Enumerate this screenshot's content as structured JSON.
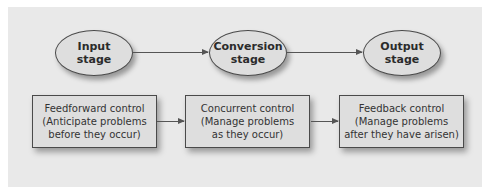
{
  "stages": [
    {
      "line1": "Input",
      "line2": "stage"
    },
    {
      "line1": "Conversion",
      "line2": "stage"
    },
    {
      "line1": "Output",
      "line2": "stage"
    }
  ],
  "controls": [
    {
      "title": "Feedforward control",
      "line2": "(Anticipate problems",
      "line3": "before they occur)"
    },
    {
      "title": "Concurrent control",
      "line2": "(Manage problems",
      "line3": "as they occur)"
    },
    {
      "title": "Feedback control",
      "line2": "(Manage problems",
      "line3": "after they have arisen)"
    }
  ],
  "colors": {
    "panel": "#e9e9e9",
    "shape_fill": "#dedede",
    "stroke": "#4a4a4a"
  }
}
